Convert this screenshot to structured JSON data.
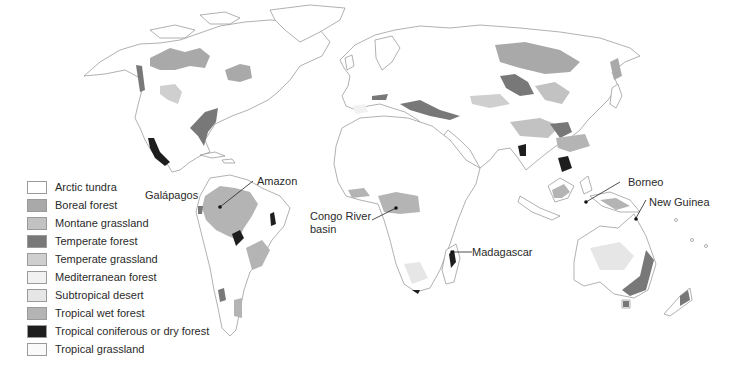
{
  "legend": {
    "items": [
      {
        "label": "Arctic tundra",
        "color": "#ffffff"
      },
      {
        "label": "Boreal forest",
        "color": "#a9a9a9"
      },
      {
        "label": "Montane grassland",
        "color": "#c2c2c2"
      },
      {
        "label": "Temperate forest",
        "color": "#787878"
      },
      {
        "label": "Temperate grassland",
        "color": "#cfcfcf"
      },
      {
        "label": "Mediterranean forest",
        "color": "#f1f1f1"
      },
      {
        "label": "Subtropical desert",
        "color": "#e6e6e6"
      },
      {
        "label": "Tropical wet forest",
        "color": "#b4b4b4"
      },
      {
        "label": "Tropical coniferous or dry forest",
        "color": "#1e1e1e"
      },
      {
        "label": "Tropical grassland",
        "color": "#fafafa"
      }
    ]
  },
  "callouts": {
    "galapagos": "Galápagos",
    "amazon": "Amazon",
    "congo_line1": "Congo River",
    "congo_line2": "basin",
    "madagascar": "Madagascar",
    "borneo": "Borneo",
    "new_guinea": "New Guinea"
  }
}
